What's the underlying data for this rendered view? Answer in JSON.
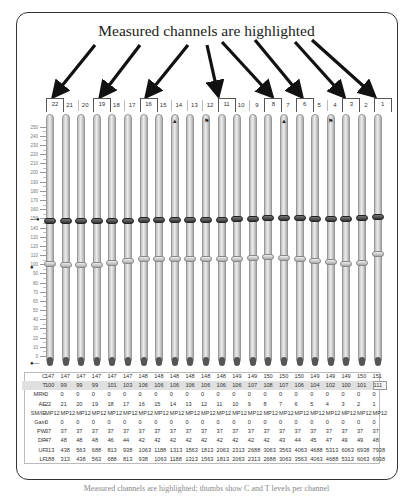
{
  "annotation": {
    "title": "Measured channels are highlighted",
    "highlighted_channels": [
      22,
      19,
      16,
      11,
      8,
      6,
      3,
      1
    ]
  },
  "channels": [
    22,
    21,
    20,
    19,
    18,
    17,
    16,
    15,
    14,
    13,
    12,
    11,
    10,
    9,
    8,
    7,
    6,
    5,
    4,
    3,
    2,
    1
  ],
  "slider_icons": {
    "14": "lock-icon",
    "12": "flag-icon",
    "7": "lock-icon",
    "4": "flag-icon"
  },
  "scale": {
    "labels": [
      "250",
      "240",
      "230",
      "220",
      "210",
      "200",
      "190",
      "180",
      "170",
      "160",
      "150",
      "140",
      "130",
      "120",
      "110",
      "100",
      "90",
      "80",
      "70",
      "60",
      "50",
      "40",
      "30",
      "20",
      "10",
      "0"
    ],
    "min": 0,
    "max": 255
  },
  "table": {
    "row_labels": [
      "C",
      "T",
      "MRK",
      "AE",
      "SM/IE",
      "Gain",
      "PW",
      "DR",
      "UF",
      "LF"
    ],
    "rows": {
      "C": [
        "147",
        "147",
        "147",
        "147",
        "147",
        "147",
        "148",
        "148",
        "148",
        "148",
        "148",
        "149",
        "149",
        "150",
        "150",
        "150",
        "149",
        "149",
        "149",
        "150",
        "151"
      ],
      "T": [
        "100",
        "99",
        "99",
        "99",
        "101",
        "103",
        "106",
        "106",
        "106",
        "106",
        "106",
        "106",
        "107",
        "108",
        "107",
        "106",
        "104",
        "102",
        "100",
        "101",
        "111"
      ],
      "MRK": [
        "0",
        "0",
        "0",
        "0",
        "0",
        "0",
        "0",
        "0",
        "0",
        "0",
        "0",
        "0",
        "0",
        "0",
        "0",
        "0",
        "0",
        "0",
        "0",
        "0",
        "0",
        "0"
      ],
      "AE": [
        "22",
        "21",
        "20",
        "19",
        "18",
        "17",
        "16",
        "15",
        "14",
        "13",
        "12",
        "11",
        "10",
        "9",
        "8",
        "7",
        "6",
        "5",
        "4",
        "3",
        "2",
        "1"
      ],
      "SMIE": [
        "MP12",
        "MP12",
        "MP12",
        "MP12",
        "MP12",
        "MP12",
        "MP12",
        "MP12",
        "MP12",
        "MP12",
        "MP12",
        "MP12",
        "MP12",
        "MP12",
        "MP12",
        "MP12",
        "MP12",
        "MP12",
        "MP12",
        "MP12",
        "MP12",
        "MP12"
      ],
      "Gain": [
        "0",
        "0",
        "0",
        "0",
        "0",
        "0",
        "0",
        "0",
        "0",
        "0",
        "0",
        "0",
        "0",
        "0",
        "0",
        "0",
        "0",
        "0",
        "0",
        "0",
        "0",
        "0"
      ],
      "PW": [
        "37",
        "37",
        "37",
        "37",
        "37",
        "37",
        "37",
        "37",
        "37",
        "37",
        "37",
        "37",
        "37",
        "37",
        "37",
        "37",
        "37",
        "37",
        "37",
        "37",
        "37",
        "37"
      ],
      "DR": [
        "47",
        "48",
        "48",
        "48",
        "46",
        "44",
        "42",
        "42",
        "42",
        "42",
        "42",
        "42",
        "42",
        "42",
        "42",
        "43",
        "44",
        "45",
        "47",
        "49",
        "49",
        "48"
      ],
      "UF": [
        "313",
        "438",
        "563",
        "688",
        "813",
        "938",
        "1063",
        "1188",
        "1313",
        "1563",
        "1813",
        "2063",
        "2313",
        "2688",
        "3063",
        "3563",
        "4063",
        "4688",
        "5313",
        "6063",
        "6938",
        "7938"
      ],
      "LF": [
        "188",
        "313",
        "438",
        "563",
        "688",
        "813",
        "938",
        "1063",
        "1188",
        "1313",
        "1563",
        "1813",
        "2063",
        "2313",
        "2688",
        "3063",
        "3563",
        "4063",
        "4688",
        "5313",
        "6063",
        "6938"
      ]
    },
    "c_values_full": [
      147,
      147,
      147,
      147,
      147,
      147,
      148,
      148,
      148,
      148,
      148,
      148,
      149,
      149,
      150,
      150,
      150,
      149,
      149,
      149,
      150,
      151
    ],
    "t_values_full": [
      100,
      99,
      99,
      99,
      101,
      103,
      106,
      106,
      106,
      106,
      106,
      106,
      106,
      107,
      108,
      107,
      106,
      104,
      102,
      100,
      101,
      111
    ]
  },
  "markers": {
    "c_marker_value": 148,
    "t_marker_value": 103,
    "bottom_marker_value": 0
  },
  "caption_bottom": "Measured channels are highlighted; thumbs show C and T levels per channel"
}
